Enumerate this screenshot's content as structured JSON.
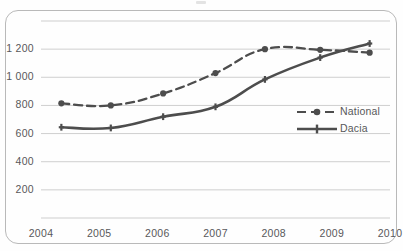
{
  "figure": {
    "background_color": "#fefefe",
    "frame_color": "#b9b9b9",
    "series_color_national": "#4d4d4d",
    "series_color_dacia": "#4d4d4d",
    "grid_color": "#c9c9c9",
    "text_color": "#58585a"
  },
  "chart_data": {
    "type": "line",
    "title": "",
    "subtitle": "",
    "xlabel": "",
    "ylabel": "",
    "xlim": [
      2004,
      2010
    ],
    "ylim": [
      0,
      1400
    ],
    "grid": true,
    "grid_axis": "y",
    "legend_position": "right-middle",
    "y_ticks": [
      200,
      400,
      600,
      800,
      1000,
      1200
    ],
    "y_tick_labels": [
      "200",
      "400",
      "600",
      "800",
      "1 000",
      "1 200"
    ],
    "x_ticks": [
      2004,
      2005,
      2006,
      2007,
      2008,
      2009,
      2010
    ],
    "x_tick_labels": [
      "2004",
      "2005",
      "2006",
      "2007",
      "2008",
      "2009",
      "2010"
    ],
    "series": [
      {
        "name": "National",
        "style": "dashed",
        "marker": "circle",
        "x": [
          2004.35,
          2005.2,
          2006.1,
          2007.0,
          2007.85,
          2008.8,
          2009.65
        ],
        "values": [
          815,
          800,
          885,
          1030,
          1200,
          1195,
          1175
        ]
      },
      {
        "name": "Dacia",
        "style": "solid",
        "marker": "plus",
        "x": [
          2004.35,
          2005.2,
          2006.1,
          2007.0,
          2007.85,
          2008.8,
          2009.65
        ],
        "values": [
          645,
          640,
          720,
          790,
          985,
          1140,
          1240
        ]
      }
    ]
  },
  "legend": {
    "items": [
      {
        "label": "National",
        "marker": "dashed-circle-marker"
      },
      {
        "label": "Dacia",
        "marker": "solid-plus-marker"
      }
    ]
  }
}
